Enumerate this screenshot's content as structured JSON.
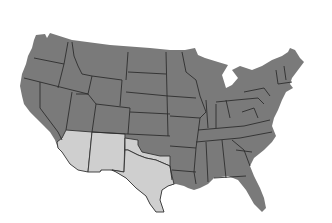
{
  "map": {
    "title": "United States map",
    "colors": {
      "background": "#ffffff",
      "default_fill": "#7a7a7a",
      "highlight_fill": "#cfcfcf",
      "border": "#2e2e2e"
    },
    "highlighted_states": [
      "Arizona",
      "New Mexico",
      "Texas",
      "Oklahoma"
    ]
  }
}
